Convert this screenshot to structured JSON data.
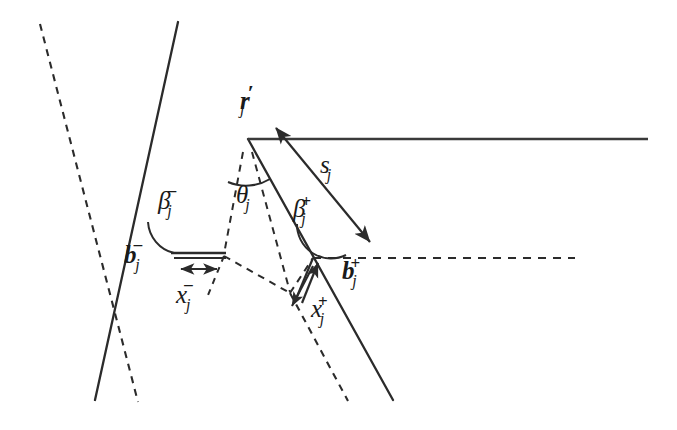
{
  "figure": {
    "background_color": "#ffffff",
    "line_color": "#2b2b2b",
    "text_color": "#1a1a1a"
  },
  "labels": {
    "apex_point": {
      "base": "r",
      "prime": "′",
      "sub": "j",
      "name": "r-prime-j"
    },
    "right_ray_length": {
      "base": "s",
      "sub": "j",
      "name": "s-j"
    },
    "apex_angle": {
      "base": "θ",
      "sub": "j",
      "name": "theta-j"
    },
    "beta_minus": {
      "base": "β",
      "sup": "−",
      "sub": "j",
      "name": "beta-minus-j"
    },
    "beta_plus": {
      "base": "β",
      "sup": "+",
      "sub": "j",
      "name": "beta-plus-j"
    },
    "b_minus": {
      "base": "b",
      "sup": "−",
      "sub": "j",
      "name": "b-minus-j"
    },
    "b_plus": {
      "base": "b",
      "sup": "+",
      "sub": "j",
      "name": "b-plus-j"
    },
    "x_minus": {
      "base": "x",
      "sup": "−",
      "sub": "j",
      "name": "x-minus-j"
    },
    "x_plus": {
      "base": "x",
      "sup": "+",
      "sub": "j",
      "name": "x-plus-j"
    }
  },
  "geometry": {
    "apex": {
      "x": 248,
      "y": 139
    },
    "solid_horizontal_ray": {
      "x1": 248,
      "y1": 139,
      "x2": 648,
      "y2": 139
    },
    "dashed_horizontal_ray": {
      "x1": 313,
      "y1": 258,
      "x2": 575,
      "y2": 258
    },
    "left_solid_ray": {
      "x1": 178,
      "y1": 22,
      "x2": 95,
      "y2": 400
    },
    "right_solid_ray": {
      "x1": 248,
      "y1": 139,
      "x2": 393,
      "y2": 400
    },
    "left_dashed_ray": {
      "x1": 40,
      "y1": 24,
      "x2": 138,
      "y2": 402
    },
    "right_dashed_ray": {
      "x1": 232,
      "y1": 160,
      "x2": 348,
      "y2": 400
    },
    "b_minus_segment": {
      "x1": 172,
      "y1": 255,
      "x2": 225,
      "y2": 255
    },
    "x_minus_arrow": {
      "x1": 180,
      "y1": 268,
      "x2": 218,
      "y2": 268,
      "double_headed": true
    },
    "s_arrow": {
      "x1": 276,
      "y1": 128,
      "x2": 369,
      "y2": 240,
      "double_headed": true
    },
    "beta_minus_vertex": {
      "x": 170,
      "y": 246
    },
    "beta_plus_vertex": {
      "x": 313,
      "y": 258
    },
    "inner_dashed_vertex": {
      "x": 290,
      "y": 293
    }
  }
}
